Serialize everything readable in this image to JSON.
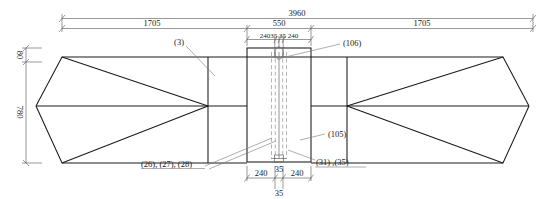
{
  "drawing": {
    "type": "engineering-elevation",
    "units_note": "mm",
    "dimensions": {
      "overall_length": "3960",
      "left_span": "1705",
      "right_span": "1705",
      "center_width": "550",
      "center_breakdown": "24035 35 240",
      "center_parts": [
        "240",
        "35",
        "35",
        "240"
      ],
      "bottom_left": "240",
      "bottom_mid": "35",
      "bottom_right": "240",
      "bottom_below": "35",
      "height_top": "80",
      "height_main": "780"
    },
    "callouts": [
      {
        "id": "c3",
        "label": "(3)"
      },
      {
        "id": "c106",
        "label": "(106)"
      },
      {
        "id": "c105",
        "label": "(105)"
      },
      {
        "id": "c2628",
        "label": "(26), (27), (28)"
      },
      {
        "id": "c3135",
        "label": "(31) ,(35)"
      }
    ]
  },
  "colors": {
    "line": "#1a1a1a",
    "dim": "#555555",
    "dash": "#9a9a9a",
    "background": "#ffffff"
  }
}
